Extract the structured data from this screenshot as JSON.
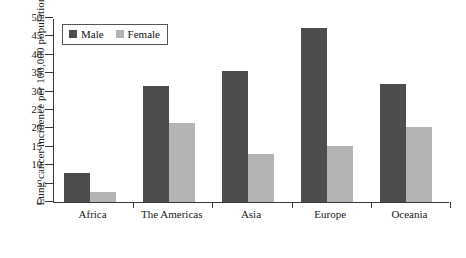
{
  "chart_data": {
    "type": "bar",
    "title": "",
    "subtitle": "",
    "xlabel": "",
    "ylabel": "Lung cancer incidence per 100,000 population",
    "categories": [
      "Africa",
      "The Americas",
      "Asia",
      "Europe",
      "Oceania"
    ],
    "series": [
      {
        "name": "Male",
        "color": "#4d4d4d",
        "values": [
          7.8,
          31.5,
          35.5,
          47.2,
          32.0
        ]
      },
      {
        "name": "Female",
        "color": "#b4b4b4",
        "values": [
          2.6,
          21.6,
          13.0,
          15.2,
          20.5
        ]
      }
    ],
    "ylim": [
      0,
      50
    ],
    "yticks": [
      0,
      5,
      10,
      15,
      20,
      25,
      30,
      35,
      40,
      45,
      50
    ],
    "ytick_labels": [
      "0",
      "5",
      "10",
      "15",
      "20",
      "25",
      "30",
      "35",
      "40",
      "45",
      "50"
    ],
    "grid": false,
    "legend": {
      "position": "top-left",
      "entries": [
        {
          "label": "Male",
          "color": "#4d4d4d"
        },
        {
          "label": "Female",
          "color": "#b4b4b4"
        }
      ]
    }
  }
}
